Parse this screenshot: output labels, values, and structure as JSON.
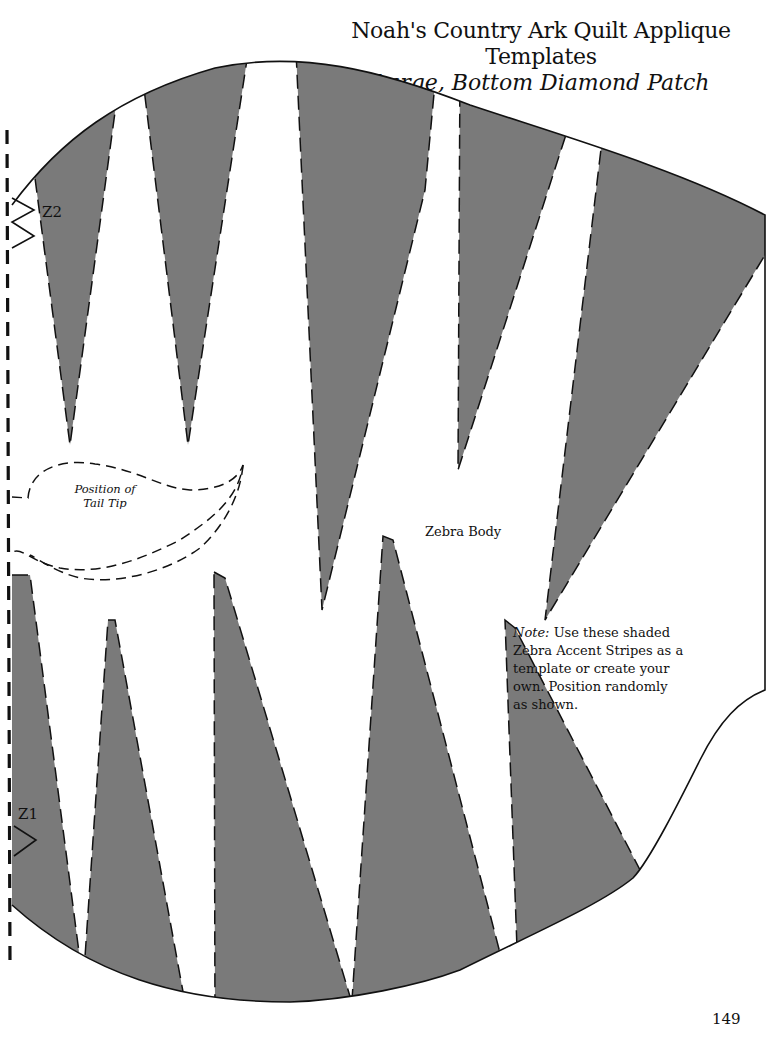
{
  "header": {
    "title": "Noah's Country Ark Quilt Applique Templates",
    "subtitle": "Large, Bottom Diamond Patch"
  },
  "template": {
    "markers": {
      "z2": "Z2",
      "z1": "Z1"
    },
    "tail_tip_label_line1": "Position of",
    "tail_tip_label_line2": "Tail Tip",
    "body_label": "Zebra Body",
    "note": {
      "prefix": "Note:",
      "text": "Use these shaded Zebra Accent Stripes as a template or create your own. Position randomly as shown."
    },
    "stripe_color": "#7a7a7a",
    "outline_color": "#111111"
  },
  "footer": {
    "page_number": "149"
  }
}
